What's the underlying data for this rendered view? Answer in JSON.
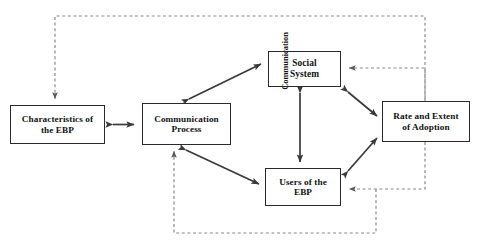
{
  "diagram": {
    "title_fragment": "",
    "colors": {
      "box_border": "#2b2b2b",
      "solid_arrow": "#3a3a3a",
      "dashed_feedback": "#8a8a8a",
      "background": "#ffffff",
      "text": "#121212"
    },
    "nodes": [
      {
        "id": "characteristics",
        "line1": "Characteristics of",
        "line2": "the EBP"
      },
      {
        "id": "communication_process",
        "line1": "Communication",
        "line2": "Process"
      },
      {
        "id": "social_system",
        "line1": "Social",
        "line2": "System"
      },
      {
        "id": "users",
        "line1": "Users of the",
        "line2": "EBP"
      },
      {
        "id": "rate_extent",
        "line1": "Rate and Extent",
        "line2": "of Adoption"
      }
    ],
    "edge_labels": [
      {
        "id": "communication_channel",
        "text": "Communication",
        "orientation": "vertical"
      }
    ],
    "solid_edges": [
      {
        "from": "characteristics",
        "to": "communication_process",
        "style": "double-headed"
      },
      {
        "from": "communication_process",
        "to": "social_system",
        "style": "double-headed"
      },
      {
        "from": "communication_process",
        "to": "users",
        "style": "double-headed"
      },
      {
        "from": "social_system",
        "to": "users",
        "style": "double-headed"
      },
      {
        "from": "social_system",
        "to": "rate_extent",
        "style": "double-headed"
      },
      {
        "from": "users",
        "to": "rate_extent",
        "style": "double-headed"
      }
    ],
    "dashed_edges": [
      {
        "from": "rate_extent",
        "to": "characteristics",
        "style": "single-headed-feedback"
      },
      {
        "from": "rate_extent",
        "to": "social_system",
        "style": "single-headed-feedback"
      },
      {
        "from": "rate_extent",
        "to": "users",
        "style": "single-headed-feedback"
      },
      {
        "from": "rate_extent",
        "to": "communication_process",
        "style": "single-headed-feedback"
      }
    ]
  }
}
